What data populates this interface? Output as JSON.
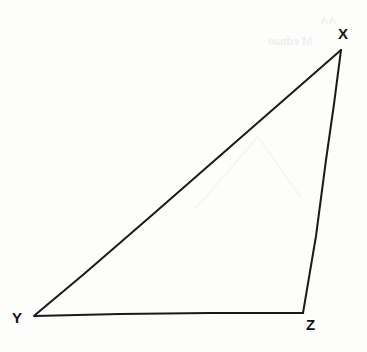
{
  "figure": {
    "name": "triangle-xyz",
    "kind": "geometry-diagram",
    "width": 367,
    "height": 352,
    "background_color": "#fdfdfc",
    "stroke_color": "#1a1a1a",
    "stroke_width": 2,
    "fill": "none",
    "label_color": "#141414",
    "shape": "triangle",
    "vertices": [
      {
        "id": "X",
        "label": "X",
        "x": 341,
        "y": 49,
        "label_x": 338,
        "label_y": 26,
        "position": "apex-upper-right"
      },
      {
        "id": "Y",
        "label": "Y",
        "x": 34,
        "y": 316,
        "label_x": 12,
        "label_y": 310,
        "position": "lower-left"
      },
      {
        "id": "Z",
        "label": "Z",
        "x": 303,
        "y": 313,
        "label_x": 306,
        "label_y": 317,
        "position": "lower-right"
      }
    ],
    "edges": [
      {
        "id": "XY",
        "from": "X",
        "to": "Y",
        "role": "hypotenuse"
      },
      {
        "id": "YZ",
        "from": "Y",
        "to": "Z",
        "role": "base"
      },
      {
        "id": "ZX",
        "from": "Z",
        "to": "X",
        "role": "right-side"
      }
    ],
    "paths": {
      "hypotenuse_xy": "M 341,50 L 246,133 L 151,216 L 84,274 L 35,315",
      "base_yz": "M 34,316 L 120,314 L 210,313 L 303,313",
      "side_zx": "M 303,313 L 316,236 L 326,160 L 334,104 L 341,50"
    }
  },
  "artifacts": {
    "ghost_color": "#efefee",
    "ghost_upper_text": "M ednao",
    "ghost_corner_text": "AA",
    "ghost_chevron_path": "M 196,208 L 258,137 L 300,196",
    "ghost_chevron_color": "#f7f6f5"
  }
}
